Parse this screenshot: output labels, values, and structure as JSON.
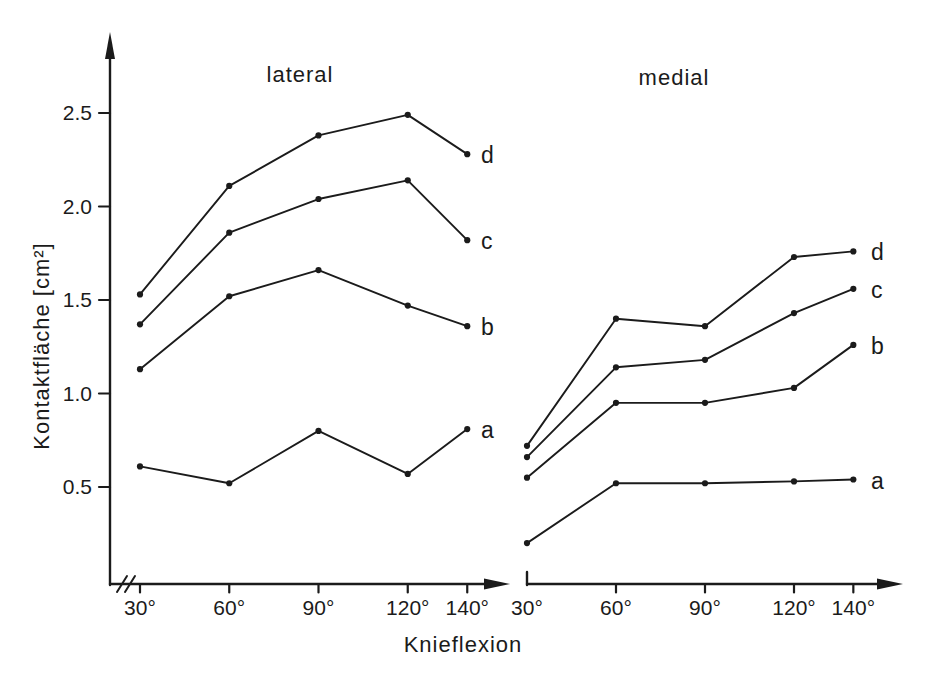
{
  "colors": {
    "ink": "#1b1b1b",
    "background": "#ffffff"
  },
  "chart_data": {
    "type": "line",
    "title": "",
    "xlabel": "Knieflexion",
    "ylabel": "Kontaktfläche [cm²]",
    "ylim": [
      0,
      2.8
    ],
    "yticks": [
      0.5,
      1.0,
      1.5,
      2.0,
      2.5
    ],
    "ytick_labels": [
      "0.5",
      "1.0",
      "1.5",
      "2.0",
      "2.5"
    ],
    "categories_deg": [
      30,
      60,
      90,
      120,
      140
    ],
    "xtick_labels": [
      "30°",
      "60°",
      "90°",
      "120°",
      "140°"
    ],
    "x_axis_break_before_first_tick": true,
    "grid": false,
    "marker": "dot",
    "legend_position": "right-of-last-point",
    "panels": [
      {
        "name": "lateral",
        "series": [
          {
            "name": "a",
            "values": [
              0.61,
              0.52,
              0.8,
              0.57,
              0.81
            ]
          },
          {
            "name": "b",
            "values": [
              1.13,
              1.52,
              1.66,
              1.47,
              1.36
            ]
          },
          {
            "name": "c",
            "values": [
              1.37,
              1.86,
              2.04,
              2.14,
              1.82
            ]
          },
          {
            "name": "d",
            "values": [
              1.53,
              2.11,
              2.38,
              2.49,
              2.28
            ]
          }
        ]
      },
      {
        "name": "medial",
        "series": [
          {
            "name": "a",
            "values": [
              0.2,
              0.52,
              0.52,
              0.53,
              0.54
            ]
          },
          {
            "name": "b",
            "values": [
              0.55,
              0.95,
              0.95,
              1.03,
              1.26
            ]
          },
          {
            "name": "c",
            "values": [
              0.66,
              1.14,
              1.18,
              1.43,
              1.56
            ]
          },
          {
            "name": "d",
            "values": [
              0.72,
              1.4,
              1.36,
              1.73,
              1.76
            ]
          }
        ]
      }
    ]
  }
}
